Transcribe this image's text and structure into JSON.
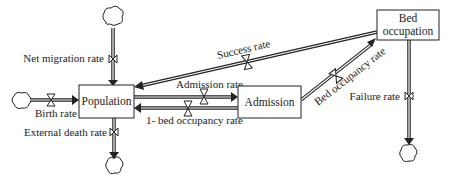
{
  "diagram": {
    "type": "stock-and-flow",
    "stocks": [
      {
        "id": "population",
        "label": "Population"
      },
      {
        "id": "admission",
        "label": "Admission"
      },
      {
        "id": "bed_occupation",
        "label_line1": "Bed",
        "label_line2": "occupation"
      }
    ],
    "flows": [
      {
        "id": "net_migration",
        "label": "Net migration rate",
        "from": "cloud",
        "to": "population"
      },
      {
        "id": "birth",
        "label": "Birth rate",
        "from": "cloud",
        "to": "population"
      },
      {
        "id": "external_death",
        "label": "External death rate",
        "from": "population",
        "to": "cloud"
      },
      {
        "id": "admission_rate",
        "label": "Admission rate",
        "from": "population",
        "to": "admission"
      },
      {
        "id": "one_minus_bed",
        "label": "1- bed occupancy rate",
        "from": "admission",
        "to": "population"
      },
      {
        "id": "bed_occupancy",
        "label": "Bed occupancy rate",
        "from": "admission",
        "to": "bed_occupation"
      },
      {
        "id": "success",
        "label": "Success rate",
        "from": "bed_occupation",
        "to": "population"
      },
      {
        "id": "failure",
        "label": "Failure rate",
        "from": "bed_occupation",
        "to": "cloud"
      }
    ],
    "colors": {
      "line": "#222222",
      "background": "#ffffff"
    }
  }
}
